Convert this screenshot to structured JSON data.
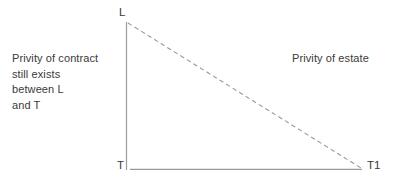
{
  "diagram": {
    "background_color": "#ffffff",
    "line_color": "#9a9a9a",
    "text_color": "#3a3a3a",
    "width": 397,
    "height": 181,
    "annotations": {
      "left_text": "Privity of contract\nstill exists\nbetween L\nand T",
      "right_text": "Privity of estate"
    },
    "nodes": [
      {
        "id": "L",
        "label": "L",
        "role": "landlord",
        "x": 126,
        "y": 22
      },
      {
        "id": "T",
        "label": "T",
        "role": "original-tenant",
        "x": 126,
        "y": 169
      },
      {
        "id": "T1",
        "label": "T1",
        "role": "assignee-tenant",
        "x": 362,
        "y": 169
      }
    ],
    "edges": [
      {
        "id": "L-T",
        "from": "L",
        "to": "T",
        "style": "solid",
        "orientation": "vertical"
      },
      {
        "id": "T-T1",
        "from": "T",
        "to": "T1",
        "style": "solid",
        "orientation": "horizontal"
      },
      {
        "id": "L-T1",
        "from": "L",
        "to": "T1",
        "style": "dashed",
        "orientation": "diagonal"
      }
    ]
  }
}
